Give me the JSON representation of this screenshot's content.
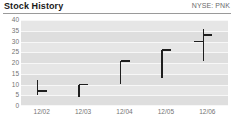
{
  "header": {
    "title": "Stock History",
    "ticker": "NYSE: PNK"
  },
  "chart_data": {
    "type": "bar",
    "subtype": "ohlc-hlc-bars",
    "title": "Stock History",
    "subtitle": "NYSE: PNK",
    "xlabel": "",
    "ylabel": "",
    "categories": [
      "12/02",
      "12/03",
      "12/04",
      "12/05",
      "12/06"
    ],
    "yticks": [
      0,
      5,
      10,
      15,
      20,
      25,
      30,
      35,
      40
    ],
    "ylim": [
      0,
      40
    ],
    "grid": true,
    "legend": false,
    "series": [
      {
        "name": "Price",
        "points": [
          {
            "x": "12/02",
            "high": 12,
            "low": 5,
            "open": null,
            "close": 7
          },
          {
            "x": "12/03",
            "high": 10,
            "low": 4,
            "open": null,
            "close": 10
          },
          {
            "x": "12/04",
            "high": 21,
            "low": 10,
            "open": null,
            "close": 21
          },
          {
            "x": "12/05",
            "high": 26,
            "low": 13,
            "open": null,
            "close": 26
          },
          {
            "x": "12/06",
            "high": 36,
            "low": 21,
            "open": 30,
            "close": 33
          }
        ]
      }
    ],
    "colors": {
      "bar": "#1f1f1f",
      "plot_background": "#e6e6e6",
      "band": "#dedede",
      "gridline": "#f7f7f7",
      "axis_text": "#737373",
      "title_text": "#1a1a1a",
      "ticker_text": "#6b6b6b",
      "rule": "#9a9a9a"
    }
  }
}
